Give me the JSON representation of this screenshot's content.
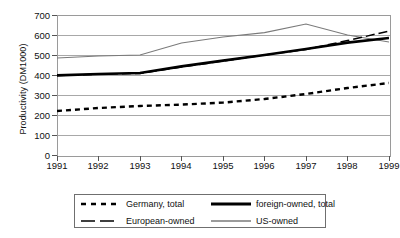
{
  "chart_data": {
    "type": "line",
    "title": "",
    "xlabel": "",
    "ylabel": "Productivity (DM1000)",
    "x": [
      1991,
      1992,
      1993,
      1994,
      1995,
      1996,
      1997,
      1998,
      1999
    ],
    "xtick_labels": [
      "1991",
      "1992",
      "1993",
      "1994",
      "1995",
      "1996",
      "1997",
      "1998",
      "1999"
    ],
    "ytick_labels": [
      "0",
      "100",
      "200",
      "300",
      "400",
      "500",
      "600",
      "700"
    ],
    "yticks": [
      0,
      100,
      200,
      300,
      400,
      500,
      600,
      700
    ],
    "ylim": [
      0,
      700
    ],
    "xlim": [
      1991,
      1999
    ],
    "grid": true,
    "legend_position": "bottom",
    "series": [
      {
        "name": "Germany, total",
        "style": "dotted",
        "color": "#000000",
        "values": [
          220,
          235,
          245,
          252,
          262,
          280,
          305,
          335,
          360
        ]
      },
      {
        "name": "foreign-owned, total",
        "style": "thick-solid",
        "color": "#000000",
        "values": [
          398,
          405,
          410,
          443,
          472,
          500,
          530,
          562,
          585
        ]
      },
      {
        "name": "European-owned",
        "style": "dashed",
        "color": "#000000",
        "values": [
          398,
          404,
          408,
          440,
          470,
          500,
          528,
          572,
          620
        ]
      },
      {
        "name": "US-owned",
        "style": "thin-solid",
        "color": "#7a7a7a",
        "values": [
          485,
          495,
          500,
          560,
          590,
          612,
          655,
          600,
          565
        ]
      }
    ]
  },
  "legend": {
    "entries": [
      {
        "label": "Germany, total",
        "swatch": "dotted-swatch"
      },
      {
        "label": "foreign-owned, total",
        "swatch": "thick-solid-swatch"
      },
      {
        "label": "European-owned",
        "swatch": "dashed-swatch"
      },
      {
        "label": "US-owned",
        "swatch": "thin-solid-swatch"
      }
    ]
  }
}
